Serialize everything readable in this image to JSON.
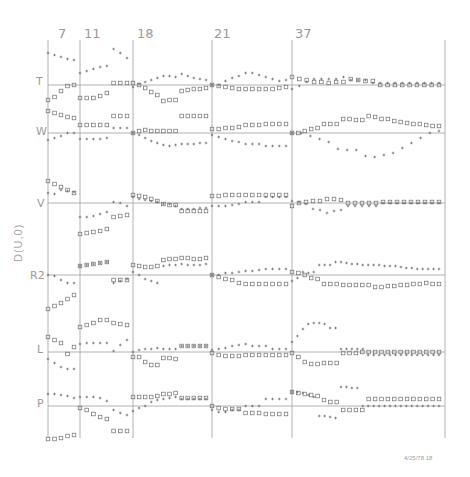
{
  "chart_data": {
    "type": "scatter",
    "title": "",
    "ylabel": "D(U,0)",
    "timestamp": "4/25/78 18",
    "grid": true,
    "markers": {
      "plus": "+",
      "square": "□"
    },
    "colors": {
      "axis": "#a0a0a0",
      "marker": "#6e6e6e",
      "label": "#9a9a9a"
    },
    "columns": [
      {
        "label": "7",
        "x0": 48,
        "x1": 80
      },
      {
        "label": "11",
        "x0": 80,
        "x1": 133
      },
      {
        "label": "18",
        "x0": 133,
        "x1": 212
      },
      {
        "label": "21",
        "x0": 212,
        "x1": 292
      },
      {
        "label": "37",
        "x0": 292,
        "x1": 445
      }
    ],
    "rows": [
      {
        "label": "T",
        "baseline": 85,
        "plus": [
          [
            -32,
            -30,
            -28,
            -26,
            -25
          ],
          [
            -12,
            -14,
            -16,
            -18,
            -19,
            -36,
            -32,
            -27
          ],
          [
            2,
            -1,
            -3,
            -5,
            -7,
            -9,
            -9,
            -8,
            -11,
            -9,
            -7,
            -6,
            -5
          ],
          [
            0,
            0,
            -4,
            -7,
            -9,
            -12,
            -12,
            -10,
            -8,
            -6,
            -4,
            -5
          ],
          [
            4,
            1,
            -3,
            -6,
            -6,
            -6,
            -6,
            -8,
            -5,
            -5,
            -5,
            -2,
            -2,
            -2,
            -2,
            -2,
            -2,
            -2,
            -2,
            -2,
            -2
          ]
        ],
        "square": [
          [
            15,
            12,
            6,
            1,
            0
          ],
          [
            13,
            13,
            13,
            11,
            8,
            -2,
            -2,
            -2
          ],
          [
            -2,
            0,
            3,
            7,
            10,
            16,
            15,
            15,
            6,
            5,
            4,
            4,
            3
          ],
          [
            0,
            1,
            2,
            3,
            4,
            4,
            4,
            4,
            4,
            4,
            3,
            2
          ],
          [
            -8,
            -6,
            -5,
            -3,
            -3,
            -2,
            -3,
            -3,
            -6,
            -5,
            -4,
            -4,
            0,
            0,
            0,
            0,
            0,
            0,
            0,
            0,
            0
          ]
        ]
      },
      {
        "label": "W",
        "baseline": 133,
        "plus": [
          [
            7,
            5,
            3,
            0,
            0
          ],
          [
            6,
            6,
            6,
            6,
            5,
            -5,
            -5,
            -5
          ],
          [
            0,
            2,
            5,
            8,
            10,
            12,
            13,
            12,
            11,
            11,
            11,
            10,
            10
          ],
          [
            2,
            4,
            6,
            8,
            9,
            11,
            11,
            11,
            13,
            13,
            13,
            13
          ],
          [
            0,
            0,
            3,
            6,
            9,
            16,
            17,
            17,
            23,
            24,
            22,
            20,
            15,
            10,
            5,
            0,
            -2
          ]
        ],
        "square": [
          [
            -22,
            -20,
            -18,
            -16,
            -15
          ],
          [
            -8,
            -8,
            -8,
            -8,
            -8,
            -17,
            -17,
            -17
          ],
          [
            0,
            -2,
            -3,
            -2,
            -2,
            -2,
            -2,
            -2,
            -17,
            -17,
            -17,
            -17,
            -17
          ],
          [
            -4,
            -4,
            -5,
            -5,
            -6,
            -8,
            -8,
            -8,
            -9,
            -9,
            -9,
            -9
          ],
          [
            0,
            0,
            -2,
            -4,
            -5,
            -9,
            -9,
            -9,
            -14,
            -14,
            -13,
            -13,
            -17,
            -16,
            -14,
            -14,
            -12,
            -11,
            -10,
            -9,
            -9,
            -8,
            -7,
            -7
          ]
        ]
      },
      {
        "label": "V",
        "baseline": 203,
        "plus": [
          [
            -10,
            -9,
            -13,
            -12,
            -11
          ],
          [
            14,
            14,
            13,
            11,
            9,
            -1,
            0,
            3
          ],
          [
            -6,
            -4,
            -3,
            -2,
            -1,
            1,
            1,
            3,
            6,
            6,
            6,
            5,
            5
          ],
          [
            3,
            3,
            3,
            2,
            1,
            -1,
            -1,
            -1,
            -6,
            -6,
            -6,
            -6
          ],
          [
            -2,
            -1,
            1,
            6,
            7,
            10,
            8,
            7,
            3,
            3,
            3,
            3,
            3,
            0,
            0,
            0,
            0,
            0,
            0,
            0,
            0,
            0
          ]
        ],
        "square": [
          [
            -22,
            -19,
            -16,
            -13,
            -10
          ],
          [
            31,
            30,
            29,
            28,
            26,
            14,
            13,
            12
          ],
          [
            -8,
            -7,
            -6,
            -4,
            -2,
            1,
            2,
            2,
            8,
            8,
            8,
            8,
            8
          ],
          [
            -7,
            -7,
            -8,
            -8,
            -8,
            -8,
            -8,
            -8,
            -8,
            -8,
            -8,
            -8
          ],
          [
            3,
            0,
            -1,
            -2,
            -2,
            -4,
            -4,
            -3,
            0,
            0,
            0,
            0,
            0,
            -1,
            -1,
            -1,
            -1,
            -1,
            -1,
            -1,
            -1,
            -1
          ]
        ]
      },
      {
        "label": "R2",
        "baseline": 275,
        "plus": [
          [
            0,
            1,
            5,
            8,
            8
          ],
          [
            -9,
            -10,
            -11,
            -12,
            -13,
            8,
            6,
            4
          ],
          [
            -3,
            0,
            4,
            6,
            8,
            -9,
            -10,
            -10,
            -11,
            -10,
            -10,
            -10,
            -11
          ],
          [
            0,
            0,
            -2,
            -2,
            -3,
            -4,
            -4,
            -5,
            -6,
            -6,
            -6,
            -6
          ],
          [
            6,
            3,
            -3,
            -2,
            -3,
            -10,
            -10,
            -10,
            -13,
            -13,
            -12,
            -11,
            -11,
            -10,
            -10,
            -10,
            -10,
            -9,
            -9,
            -9,
            -8,
            -7,
            -7,
            -6,
            -6,
            -6,
            -6,
            -6
          ]
        ],
        "square": [
          [
            34,
            31,
            28,
            24,
            20
          ],
          [
            -9,
            -10,
            -11,
            -12,
            -13,
            5,
            5,
            5
          ],
          [
            -10,
            -9,
            -8,
            -8,
            -9,
            -15,
            -16,
            -16,
            -17,
            -17,
            -16,
            -16,
            -17
          ],
          [
            0,
            2,
            4,
            5,
            8,
            9,
            9,
            9,
            9,
            9,
            9,
            9
          ],
          [
            -3,
            -2,
            0,
            3,
            4,
            9,
            9,
            9,
            10,
            10,
            10,
            10,
            10,
            12,
            12,
            11,
            11,
            10,
            10,
            9,
            9,
            8,
            9,
            9
          ]
        ]
      },
      {
        "label": "L",
        "baseline": 352,
        "plus": [
          [
            7,
            11,
            15,
            17,
            17
          ],
          [
            -8,
            -9,
            -9,
            -9,
            -9,
            -1,
            -7,
            -12
          ],
          [
            0,
            -2,
            -3,
            -3,
            -4,
            -3,
            -3,
            -3,
            -6,
            -6,
            -6,
            -6,
            -6
          ],
          [
            -2,
            -3,
            -4,
            -6,
            -7,
            -8,
            -6,
            -6,
            -6,
            -3,
            -3,
            -3
          ],
          [
            -10,
            -16,
            -23,
            -28,
            -29,
            -29,
            -28,
            -24,
            -24,
            -3,
            -3,
            -3,
            -3,
            -3,
            3,
            3,
            3,
            3,
            3,
            3,
            3,
            3,
            3,
            3,
            3,
            3,
            3,
            3
          ]
        ],
        "square": [
          [
            -15,
            -12,
            -9,
            2,
            -5
          ],
          [
            -25,
            -27,
            -29,
            -32,
            -32,
            -29,
            -28,
            -27
          ],
          [
            5,
            5,
            10,
            13,
            13,
            6,
            6,
            7,
            -6,
            -6,
            -6,
            -6,
            -6
          ],
          [
            1,
            3,
            4,
            4,
            4,
            3,
            3,
            3,
            3,
            3,
            3,
            3
          ],
          [
            1,
            5,
            10,
            12,
            12,
            11,
            11,
            11,
            1,
            1,
            1,
            0,
            0,
            0,
            0,
            0,
            0,
            0,
            0,
            0,
            0,
            0,
            0,
            0
          ]
        ]
      },
      {
        "label": "P",
        "baseline": 406,
        "plus": [
          [
            -12,
            -12,
            -11,
            -10,
            -8
          ],
          [
            -9,
            -9,
            -9,
            -8,
            -5,
            4,
            7,
            9
          ],
          [
            5,
            2,
            0,
            -4,
            -6,
            -7,
            -8,
            -9,
            -7,
            -7,
            -7,
            -7,
            -7
          ],
          [
            4,
            6,
            6,
            4,
            4,
            0,
            0,
            0,
            -7,
            -7,
            -7,
            -7
          ],
          [
            -14,
            -14,
            -13,
            -11,
            -9,
            10,
            10,
            11,
            12,
            -19,
            -19,
            -18,
            -18,
            0,
            0,
            0,
            0,
            0,
            0,
            0,
            0,
            0,
            0,
            0,
            0,
            0,
            0,
            0
          ]
        ],
        "square": [
          [
            33,
            33,
            32,
            30,
            29
          ],
          [
            2,
            4,
            8,
            11,
            13,
            25,
            25,
            25
          ],
          [
            -9,
            -9,
            -9,
            -9,
            -10,
            -12,
            -12,
            -13,
            -8,
            -8,
            -8,
            -8,
            -8
          ],
          [
            0,
            2,
            3,
            3,
            3,
            7,
            7,
            7,
            8,
            8,
            8,
            8
          ],
          [
            -14,
            -13,
            -12,
            -11,
            -10,
            -6,
            -4,
            -4,
            4,
            4,
            4,
            4,
            -7,
            -7,
            -7,
            -7,
            -7,
            -7,
            -7,
            -7,
            -7,
            -7,
            -7,
            -7
          ]
        ]
      }
    ],
    "xlim": [
      48,
      445
    ],
    "ylim": [
      40,
      438
    ]
  }
}
